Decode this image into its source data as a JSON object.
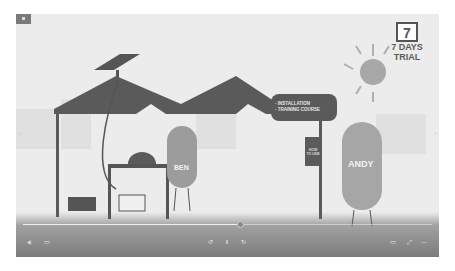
{
  "video": {
    "scene": {
      "trial_badge": {
        "day_number": "7",
        "line1": "7 DAYS",
        "line2": "TRIAL"
      },
      "speech_bubble": {
        "items": [
          "· INSTALLATION",
          "· TRAINING COURSE"
        ]
      },
      "sign": {
        "line1": "HOW",
        "line2": "TO USE"
      },
      "characters": [
        {
          "name": "BEN"
        },
        {
          "name": "ANDY"
        }
      ]
    },
    "controls": {
      "progress_percent": 53,
      "icons": {
        "volume": "volume-icon",
        "subtitles": "subtitles-icon",
        "rewind": "rewind-icon",
        "pause": "pause-icon",
        "forward": "forward-icon",
        "theater": "theater-mode-icon",
        "fullscreen": "fullscreen-icon",
        "more": "more-icon"
      }
    },
    "nav": {
      "prev": "‹",
      "next": "›"
    }
  },
  "colors": {
    "roof": "#5a5a5a",
    "background": "#ececec",
    "character": "#9a9a9a",
    "sun": "#a8a8a8"
  }
}
